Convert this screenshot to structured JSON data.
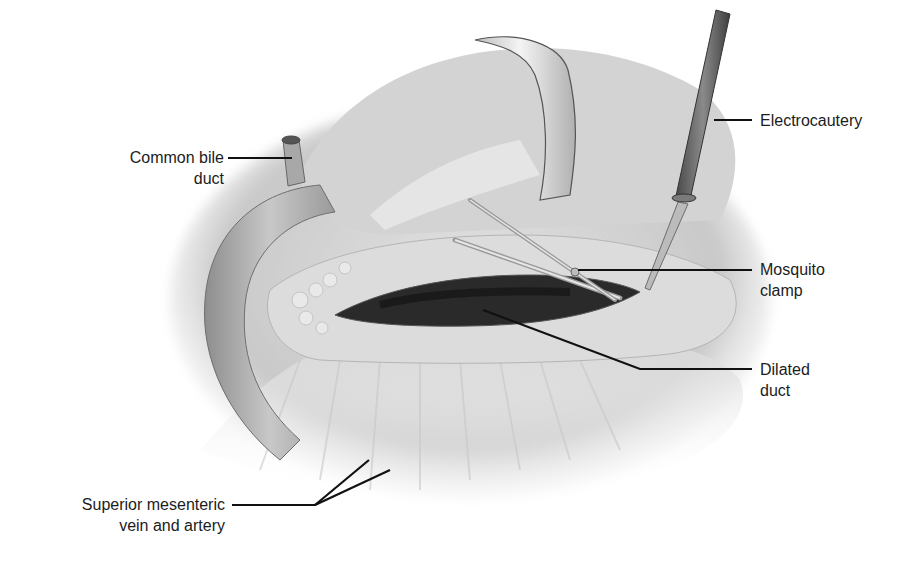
{
  "figure": {
    "type": "surgical-illustration",
    "colors": {
      "background": "#ffffff",
      "tissue_light": "#e6e6e6",
      "tissue_mid": "#bdbdbd",
      "tissue_dark": "#8a8a8a",
      "duct_lumen": "#2a2a2a",
      "leader_line": "#111111"
    }
  },
  "labels": {
    "common_bile_duct": {
      "line1": "Common bile",
      "line2": "duct"
    },
    "electrocautery": {
      "line1": "Electrocautery"
    },
    "mosquito_clamp": {
      "line1": "Mosquito",
      "line2": "clamp"
    },
    "dilated_duct": {
      "line1": "Dilated",
      "line2": "duct"
    },
    "superior_mesenteric": {
      "line1": "Superior mesenteric",
      "line2": "vein and artery"
    }
  }
}
